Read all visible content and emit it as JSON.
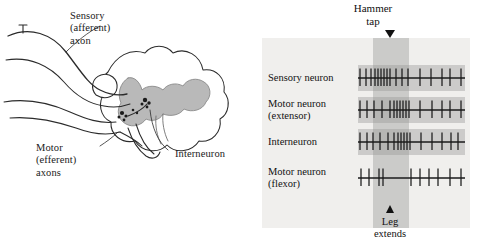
{
  "left_panel": {
    "name": "reflex-arc-diagram",
    "annotations": [
      {
        "id": "sensory-axon",
        "text": "Sensory\n(afferent)\naxon"
      },
      {
        "id": "motor-axons",
        "text": "Motor\n(efferent)\naxons"
      },
      {
        "id": "interneuron",
        "text": "Interneuron"
      }
    ],
    "colors": {
      "outline": "#2b2b2b",
      "gray_matter": "#b9b9b9",
      "white_matter": "#ffffff",
      "synapse": "#1b1b1b"
    }
  },
  "right_panel": {
    "name": "spike-recording-panel",
    "background": "#f0efed",
    "stimulus_band_color": "#787878",
    "trace_strip_color": "#969696",
    "top_label": "Hammer\ntap",
    "bottom_label": "Leg\nextends",
    "rows": [
      {
        "label": "Sensory neuron",
        "strip": true
      },
      {
        "label": "Motor neuron\n(extensor)",
        "strip": true
      },
      {
        "label": "Interneuron",
        "strip": true
      },
      {
        "label": "Motor neuron\n(flexor)",
        "strip": false
      }
    ]
  },
  "chart_data": {
    "type": "scatter",
    "xlabel": "Time",
    "ylabel": "Neuron",
    "xlim": [
      0,
      107
    ],
    "grid": false,
    "legend": "none",
    "annotations": [
      {
        "text": "Hammer tap",
        "x": 19,
        "position": "top"
      },
      {
        "text": "Leg extends",
        "x": 19,
        "position": "bottom"
      }
    ],
    "stimulus_window": {
      "x_start": 15,
      "x_end": 51
    },
    "series": [
      {
        "name": "Sensory neuron",
        "spike_times": [
          2,
          8,
          13,
          17,
          20,
          23,
          26,
          29,
          32,
          38,
          44,
          50,
          62,
          73,
          84,
          92,
          103
        ],
        "spike_count": 17
      },
      {
        "name": "Motor neuron (extensor)",
        "spike_times": [
          2,
          9,
          16,
          24,
          32,
          36,
          39,
          42,
          45,
          48,
          51,
          62,
          74,
          84,
          92,
          103
        ],
        "spike_count": 16
      },
      {
        "name": "Interneuron",
        "spike_times": [
          2,
          9,
          15,
          22,
          30,
          36,
          40,
          43,
          46,
          49,
          52,
          63,
          74,
          84,
          93,
          100
        ],
        "spike_count": 16
      },
      {
        "name": "Motor neuron (flexor)",
        "spike_times": [
          3,
          11,
          21,
          25,
          53,
          62,
          71,
          80,
          92,
          103
        ],
        "spike_count": 10
      }
    ]
  }
}
